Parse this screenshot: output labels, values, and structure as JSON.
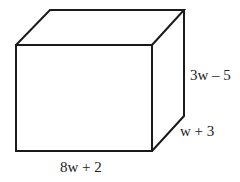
{
  "figure": {
    "type": "rectangular prism",
    "labels": {
      "height": "3w – 5",
      "depth": "w + 3",
      "length": "8w + 2"
    },
    "colors": {
      "stroke": "#1a1a1a",
      "text": "#222222",
      "background": "#ffffff"
    }
  }
}
